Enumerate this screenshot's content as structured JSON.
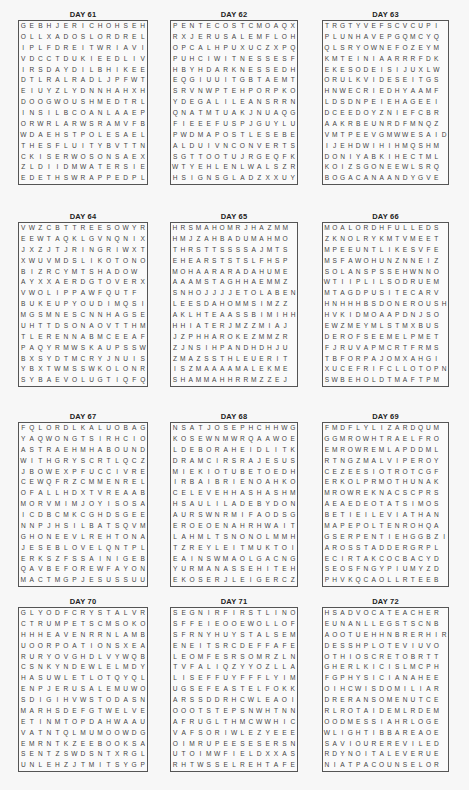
{
  "puzzles": [
    {
      "title": "DAY 61",
      "rows": [
        "GEBHJERICHOHSEH",
        "OLLXADOSLORDREL",
        "IPLFDREITWRIAVI",
        "VDCCTDUKIEEDLIV",
        "IRSDAYDILBHIKEE",
        "DTLRALRADLJPFWT",
        "EIUYZLYDNNHAHXH",
        "DOOGWOUSHMEDTRL",
        "INSILBCOANLAAEP",
        "ORWRLARWSRAMVFB",
        "WDAEHSTPOLESAEL",
        "THESFLUITYBVTTN",
        "CKISERWOSONSAEX",
        "ZLDIIDMWATERSIE",
        "EDETHSWRAPPEDPL"
      ]
    },
    {
      "title": "DAY 62",
      "rows": [
        "PENTECOSTCMOAQX",
        "RXJERUSALEMFLOH",
        "OPCALHPUXUCZXPQ",
        "PUHCIWITNESSESF",
        "HBYHDARKNESSEDH",
        "EQGIUUITGBTAEMT",
        "SRVNWPTEHPORPKO",
        "YDEGALILEANSRRN",
        "QNATMTUAKJNUAQG",
        "FIEEEFUSPJGUYLU",
        "PWDMAPOSTLESEBE",
        "ALDUIVNCONVERTS",
        "SGTTOOTUJRGEQFK",
        "WTYEHLENLWALSZR",
        "HSIGNSGLADZXXUY"
      ]
    },
    {
      "title": "DAY 63",
      "rows": [
        "TRGTYVEFSCVCUPI",
        "PLUNHAVEPGQMCYQ",
        "QLSRYOWNEFOZEYM",
        "KMTEINIAARRRFDK",
        "EKESODEISIJUXLW",
        "ORULKVIDESEITGS",
        "HNWECRIEDHYAAMF",
        "LDSDNPEIEHAGEEI",
        "DCEEDOYZNIEFCBR",
        "AAKRBEUNRDFMNQZ",
        "VMTPEEVGMWWESAID",
        "IJEHDWIHIHMQSHM",
        "DONIYABKIHECTML",
        "KOIZSGONEEWLSRQ",
        "BOGACANAANDYGVE"
      ]
    },
    {
      "title": "DAY 64",
      "rows": [
        "VWZCBTTREESOWYR",
        "EEWTAQKLGVNQNIX",
        "JXZJTJRINGRIWXT",
        "XWUVMDSLIKOTONO",
        "BIZRCYMTSHADOW",
        "AYXXAERDGTOVERX",
        "VWOLIPPAWFQUTF",
        "BUKEUPYOUDIMQSI",
        "MGSMNESCNNHAGSE",
        "UHTTDSONAOVTTHM",
        "TLERENNABMCEEAF",
        "PAQYRMWSKAUPSSW",
        "BXSYDTMCRYJNUIS",
        "YBXTWMSSWKOLONR",
        "SYBAEVOLUGTIQFQ"
      ]
    },
    {
      "title": "DAY 65",
      "rows": [
        "HRSMAHOMRJHAZMM",
        "HMJZAHBADUMAHMO",
        "THRSTTSSSSAJMTS",
        "EHEARSTSTSLFHSP",
        "MOHAARARADAHUME",
        "AAAMSTAGHHAEMMZ",
        "SNHOJJJJETOLABEN",
        "LEESDAHOMMSIMZZ",
        "AKLHTEAASSBIMIHH",
        "HHIATERJMZZMIAJ",
        "JZPHHAROKEZMMZR",
        "ZJNSIHPANDHDHJU",
        "ZMAZSSTHLEUERIT",
        "ISZMAAAAMALEKME",
        "SHAMMAHHRRMZZEJ"
      ]
    },
    {
      "title": "DAY 66",
      "rows": [
        "MOALORDHFULLEDS",
        "ZKNOLRYKMTVMEET",
        "MPEEUNTLIKESVFE",
        "MSFAWOHUNZNNEIZ",
        "SOLANSPSSEHWNNO",
        "WTIIPLILSODRUEM",
        "MTAGDPUSITECARV",
        "HNHHHBSDONEROUSH",
        "HVKIDMOAAPDNJSO",
        "EWZMEYMLSTMXBUS",
        "DEROFSEEMELPMET",
        "FJRUVAPMCRTFRMS",
        "TBFORPAJOMXAHGI",
        "XUCEFRIFCLLOTOPN",
        "SWBEHOLDTMAFTPM"
      ]
    },
    {
      "title": "DAY 67",
      "rows": [
        "FQLORDLKALUOBAG",
        "YAQWONGTSIRHCIO",
        "ASTRAEHMHABOUND",
        "WITHGRYSCRTLQCZ",
        "JBOWEXPFUCCIVRE",
        "CEWQFRZCMMENREL",
        "OFALLHDXTVREAAB",
        "MORVMIMJOYISOSA",
        "ICDBCMKCGHDSGEE",
        "NNPJHSILBATSQVM",
        "GHONEEVLREHTONA",
        "JESEBLOVELQNTPL",
        "ERKSZFSSAINIGEB",
        "QAVBEFOREWFAYON",
        "MACTMGPJESUSSUU"
      ]
    },
    {
      "title": "DAY 68",
      "rows": [
        "NSATJOSEPHCHHWG",
        "KOSEWNMWRQAAWOE",
        "LDEBORAHEIDLITK",
        "DRAMCIRSRAJESUS",
        "MIEKIOTUBETOEDH",
        "IRBAIBRIENOAHKO",
        "CELEVEHHASHASHM",
        "HSAULILADEBYDON",
        "AURSWNRMIFAODSG",
        "EROEOENAHRHWAIT",
        "LAHMLTSNONOLMMH",
        "TZREYLEITMUKTOI",
        "EAINSWMAOLGACNG",
        "YURMANASSEHITEH",
        "EKOSERJLEIGERCZ"
      ]
    },
    {
      "title": "DAY 69",
      "rows": [
        "FMDFLYLIZARDQUM",
        "GGMROWHTRAELFRO",
        "EMROWREMLAPDDML",
        "RTNGZMALVIPEROY",
        "CEZEESIOTROTCGF",
        "ERKOLPRMOTHUNAK",
        "MROWREKNACSCPRS",
        "AEAEDEOTATSIMOS",
        "BETIEILEVIATHAN",
        "MAPEPOLTENROHQA",
        "GSERPENTIEHGGBZI",
        "AROSSTADDERGRPL",
        "ECIRTAKCOCBACYD",
        "SEOSFNGYPIUMYZD",
        "PHVKQCAOLLRTEEB"
      ]
    },
    {
      "title": "DAY 70",
      "rows": [
        "GLYODFCRYSTALVR",
        "CTRUMPETSCMSOKO",
        "HHHEAVENRRNLAMB",
        "UOORPOATIONSXEA",
        "RURYOVGHDLVYWQB",
        "CSNKYNDEWLELMDY",
        "HASUWLETLOTQYQL",
        "ENPJERUSALEMUWO",
        "SDIGIHVWSTODASN",
        "MARHSDEFGTWELVE",
        "ETINMTOPDAHWAAU",
        "VATNTQLMUMOOWDG",
        "EMRNTKZEEBOOKSA",
        "SENTZSWDSNTXRGL",
        "UNLEHZJTMITSYGP"
      ]
    },
    {
      "title": "DAY 71",
      "rows": [
        "SEGNIRFIRSTLINO",
        "SFFEIEOOEWOLLOF",
        "SFRNYHUYSTALSEM",
        "ENEITSRCDEFFAFE",
        "LEOMFESRSOMRZLN",
        "TVFALIQZYYOZLLA",
        "LISEFFUYFFFLYIM",
        "UGSEFEASTELFOKK",
        "ARSSDDRHCWLEAOI",
        "OOOTSTEPSNWHTNN",
        "AFRUGLTHMCWWHIC",
        "VAFSORIWLEZYEEE",
        "OIMRUPEESESERSN",
        "UTOIMWFIELDXXAS",
        "RHTWSSELREHTAFE"
      ]
    },
    {
      "title": "DAY 72",
      "rows": [
        "HSADVOCATEACHER",
        "EUNANLLEGSTSCNB",
        "AOOTUEHHNBRERHIR",
        "DESSHPLOTEVIUVO",
        "OTHIOSCRETOBRTT",
        "GHERLKICISLMCPH",
        "FGPHYSICIANAHEE",
        "OIHCWISDOMILIAR",
        "DRERANSOMENUTCE",
        "RLROTAIDEMLRDEM",
        "OODMESSIAHRLOGE",
        "WLIGHTIBBAREAOE",
        "SAVIOUREREVILED",
        "RDYNOITALEVERUE",
        "NIATPACOUNSELOR"
      ]
    }
  ]
}
